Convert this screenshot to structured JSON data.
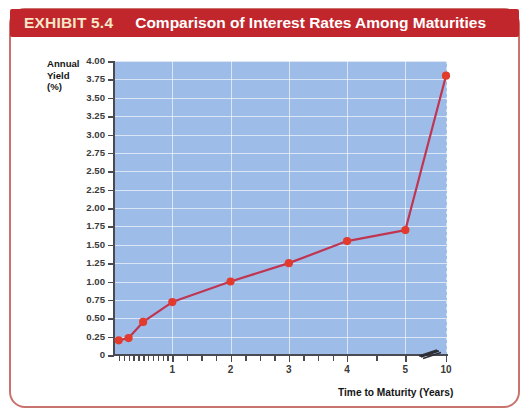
{
  "exhibit": {
    "number_label": "EXHIBIT 5.4",
    "title": "Comparison of Interest Rates Among Maturities",
    "header_bg": "#c0262c",
    "number_color": "#f7e8c8",
    "title_color": "#ffffff",
    "frame_color": "#c9736e"
  },
  "chart_data": {
    "type": "line",
    "title": "Comparison of Interest Rates Among Maturities",
    "xlabel": "Time to Maturity (Years)",
    "ylabel": "Annual Yield (%)",
    "ylabel_lines": [
      "Annual",
      "Yield",
      "(%)"
    ],
    "ylim": [
      0,
      4.0
    ],
    "ytick_labels": [
      "0",
      "0.25",
      "0.50",
      "0.75",
      "1.00",
      "1.25",
      "1.50",
      "1.75",
      "2.00",
      "2.25",
      "2.50",
      "2.75",
      "3.00",
      "3.25",
      "3.50",
      "3.75",
      "4.00"
    ],
    "ytick_values": [
      0,
      0.25,
      0.5,
      0.75,
      1.0,
      1.25,
      1.5,
      1.75,
      2.0,
      2.25,
      2.5,
      2.75,
      3.0,
      3.25,
      3.5,
      3.75,
      4.0
    ],
    "xtick_labels": [
      "1",
      "2",
      "3",
      "4",
      "5",
      "10"
    ],
    "xtick_values": [
      1,
      2,
      3,
      4,
      5,
      10
    ],
    "axis_break": true,
    "axis_break_between": [
      5,
      10
    ],
    "grid": true,
    "legend": "none",
    "plot_bg": "#9dbde8",
    "grid_color": "#ffffff",
    "series": [
      {
        "name": "Yield curve",
        "color": "#e23b2e",
        "line_color": "#bf3552",
        "x": [
          0.08,
          0.25,
          0.5,
          1,
          2,
          3,
          4,
          5,
          10
        ],
        "y": [
          0.2,
          0.23,
          0.45,
          0.72,
          1.0,
          1.25,
          1.55,
          1.7,
          3.8
        ]
      }
    ]
  }
}
